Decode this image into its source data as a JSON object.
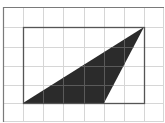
{
  "diagram": {
    "type": "grid-geometry",
    "grid": {
      "cell_size": 20.2,
      "origin_x": 3,
      "origin_y": 7,
      "cols": 8,
      "rows": 6,
      "line_color": "#d6d6d6",
      "border_color": "#7a7a7a"
    },
    "rectangle": {
      "x1": 23,
      "y1": 27,
      "x2": 144,
      "y2": 103,
      "width_units": 6,
      "height_units": 4,
      "stroke": "#555555"
    },
    "triangle": {
      "points": [
        [
          23,
          103
        ],
        [
          144,
          27
        ],
        [
          104,
          103
        ]
      ],
      "grid_points": [
        [
          1,
          5
        ],
        [
          7,
          1
        ],
        [
          5,
          5
        ]
      ],
      "fill": "#2b2b2b"
    }
  }
}
